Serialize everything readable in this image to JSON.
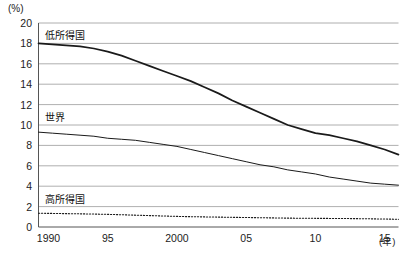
{
  "axes": {
    "y_unit": "(%)",
    "x_unit": "(年)",
    "y_ticks": [
      "20",
      "18",
      "16",
      "14",
      "12",
      "10",
      "8",
      "6",
      "4",
      "2",
      "0"
    ],
    "x_ticks": [
      "1990",
      "95",
      "2000",
      "05",
      "10",
      "15"
    ]
  },
  "series_labels": {
    "low_income": "低所得国",
    "world": "世界",
    "high_income": "高所得国"
  },
  "chart_data": {
    "type": "line",
    "title": "",
    "xlabel": "(年)",
    "ylabel": "(%)",
    "xlim": [
      1990,
      2016
    ],
    "ylim": [
      0,
      20
    ],
    "grid": true,
    "legend": "inline-labels",
    "x": [
      1990,
      1991,
      1992,
      1993,
      1994,
      1995,
      1996,
      1997,
      1998,
      1999,
      2000,
      2001,
      2002,
      2003,
      2004,
      2005,
      2006,
      2007,
      2008,
      2009,
      2010,
      2011,
      2012,
      2013,
      2014,
      2015,
      2016
    ],
    "series": [
      {
        "name": "低所得国",
        "style": "solid-thick",
        "color": "#1a1a1a",
        "values": [
          18.0,
          17.9,
          17.8,
          17.7,
          17.5,
          17.2,
          16.8,
          16.3,
          15.8,
          15.3,
          14.8,
          14.3,
          13.7,
          13.1,
          12.4,
          11.8,
          11.2,
          10.6,
          10.0,
          9.6,
          9.2,
          9.0,
          8.7,
          8.4,
          8.0,
          7.6,
          7.1
        ]
      },
      {
        "name": "世界",
        "style": "solid-thin",
        "color": "#1a1a1a",
        "values": [
          9.3,
          9.2,
          9.1,
          9.0,
          8.9,
          8.7,
          8.6,
          8.5,
          8.3,
          8.1,
          7.9,
          7.6,
          7.3,
          7.0,
          6.7,
          6.4,
          6.1,
          5.9,
          5.6,
          5.4,
          5.2,
          4.9,
          4.7,
          4.5,
          4.3,
          4.2,
          4.1
        ]
      },
      {
        "name": "高所得国",
        "style": "dotted",
        "color": "#1a1a1a",
        "values": [
          1.35,
          1.33,
          1.31,
          1.29,
          1.27,
          1.24,
          1.2,
          1.16,
          1.12,
          1.08,
          1.04,
          1.01,
          0.99,
          0.97,
          0.95,
          0.93,
          0.91,
          0.89,
          0.87,
          0.86,
          0.85,
          0.84,
          0.83,
          0.82,
          0.8,
          0.78,
          0.76
        ]
      }
    ]
  }
}
